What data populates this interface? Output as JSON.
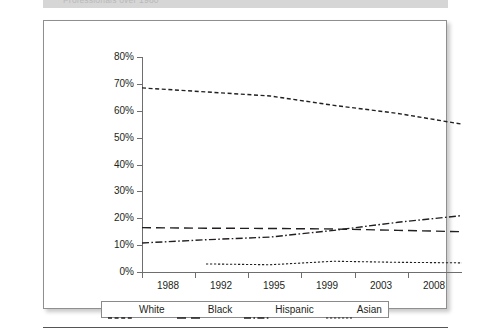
{
  "caption": {
    "text": "Professionals over 1980"
  },
  "chart_data": {
    "type": "line",
    "title": "",
    "xlabel": "",
    "ylabel": "",
    "categories": [
      "1988",
      "1992",
      "1995",
      "1999",
      "2003",
      "2008"
    ],
    "x_tick_labels": [
      "1988",
      "1992",
      "1995",
      "1999",
      "2003",
      "2008"
    ],
    "y_tick_labels": [
      "0%",
      "10%",
      "20%",
      "30%",
      "40%",
      "50%",
      "60%",
      "70%",
      "80%"
    ],
    "y_tick_values": [
      0,
      10,
      20,
      30,
      40,
      50,
      60,
      70,
      80
    ],
    "ylim": [
      0,
      80
    ],
    "grid": false,
    "legend_position": "bottom",
    "series": [
      {
        "name": "White",
        "line_style": "dashed",
        "color": "#231f20",
        "values": [
          68.5,
          67,
          65.5,
          62,
          59,
          55
        ]
      },
      {
        "name": "Black",
        "line_style": "long-dashed",
        "color": "#231f20",
        "values": [
          16.5,
          16.3,
          16.2,
          16,
          15.5,
          15
        ]
      },
      {
        "name": "Hispanic",
        "line_style": "dash-dot",
        "color": "#231f20",
        "values": [
          10.8,
          12,
          13,
          15.5,
          18.5,
          21
        ]
      },
      {
        "name": "Asian",
        "line_style": "dotted",
        "color": "#231f20",
        "values": [
          null,
          3.0,
          2.7,
          4.0,
          3.6,
          3.4
        ]
      }
    ]
  },
  "legend": {
    "items": [
      {
        "label": "White",
        "style": "dashed"
      },
      {
        "label": "Black",
        "style": "long-dashed"
      },
      {
        "label": "Hispanic",
        "style": "dash-dot"
      },
      {
        "label": "Asian",
        "style": "dotted"
      }
    ]
  }
}
